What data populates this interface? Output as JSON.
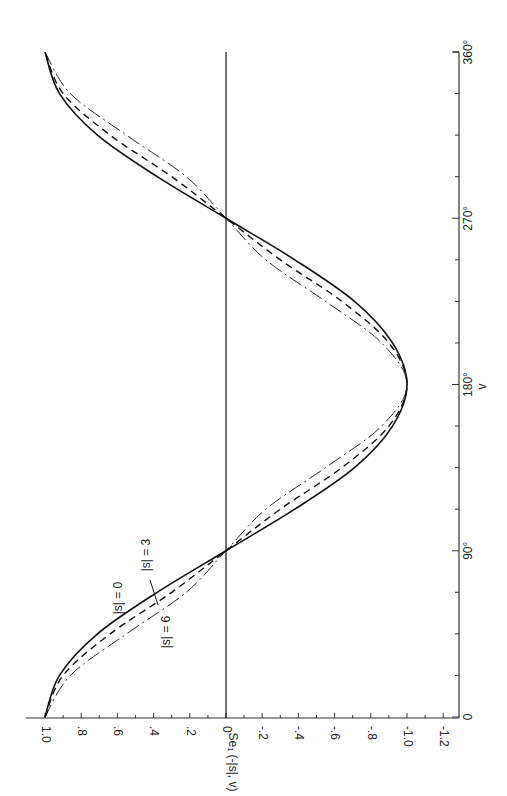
{
  "chart_data": {
    "type": "line",
    "title": "",
    "orientation_note": "figure printed rotated 90 degrees counter-clockwise",
    "xlabel": "v",
    "ylabel": "Se₁ (-|s|, v)",
    "xlim": [
      0,
      360
    ],
    "ylim": [
      -1.2,
      1.0
    ],
    "x_ticks": [
      "0",
      "90°",
      "180°",
      "270°",
      "360°"
    ],
    "x_minor_step": 22.5,
    "y_ticks": [
      "1.0",
      ".8",
      ".6",
      ".4",
      ".2",
      "0",
      "-.2",
      "-.4",
      "-.6",
      "-.8",
      "-1.0",
      "-1.2"
    ],
    "y_tick_values": [
      1.0,
      0.8,
      0.6,
      0.4,
      0.2,
      0,
      -0.2,
      -0.4,
      -0.6,
      -0.8,
      -1.0,
      -1.2
    ],
    "zero_line": true,
    "grid": false,
    "x": [
      0,
      22.5,
      45,
      67.5,
      90,
      112.5,
      135,
      157.5,
      180,
      202.5,
      225,
      247.5,
      270,
      292.5,
      315,
      337.5,
      360
    ],
    "series": [
      {
        "name": "|s| = 0",
        "style": "solid",
        "values": [
          1.0,
          0.92,
          0.71,
          0.38,
          0,
          -0.38,
          -0.71,
          -0.92,
          -1.0,
          -0.92,
          -0.71,
          -0.38,
          0,
          0.38,
          0.71,
          0.92,
          1.0
        ]
      },
      {
        "name": "|s| = 3",
        "style": "dashed",
        "values": [
          1.0,
          0.9,
          0.64,
          0.3,
          0,
          -0.3,
          -0.64,
          -0.9,
          -1.0,
          -0.9,
          -0.64,
          -0.3,
          0,
          0.3,
          0.64,
          0.9,
          1.0
        ]
      },
      {
        "name": "|s| = 6",
        "style": "dashdot",
        "values": [
          1.0,
          0.86,
          0.55,
          0.22,
          0,
          -0.22,
          -0.55,
          -0.86,
          -1.0,
          -0.86,
          -0.55,
          -0.22,
          0,
          0.22,
          0.55,
          0.86,
          1.0
        ]
      }
    ],
    "annotations": [
      {
        "text": "|s| = 0",
        "near_x": 45,
        "near_y": 0.78
      },
      {
        "text": "|s| = 3",
        "near_x": 60,
        "near_y": 0.5
      },
      {
        "text": "|s| = 6",
        "near_x": 35,
        "near_y": 0.35
      }
    ],
    "colors": {
      "line": "#111111",
      "axis": "#333333",
      "background": "#ffffff"
    }
  }
}
